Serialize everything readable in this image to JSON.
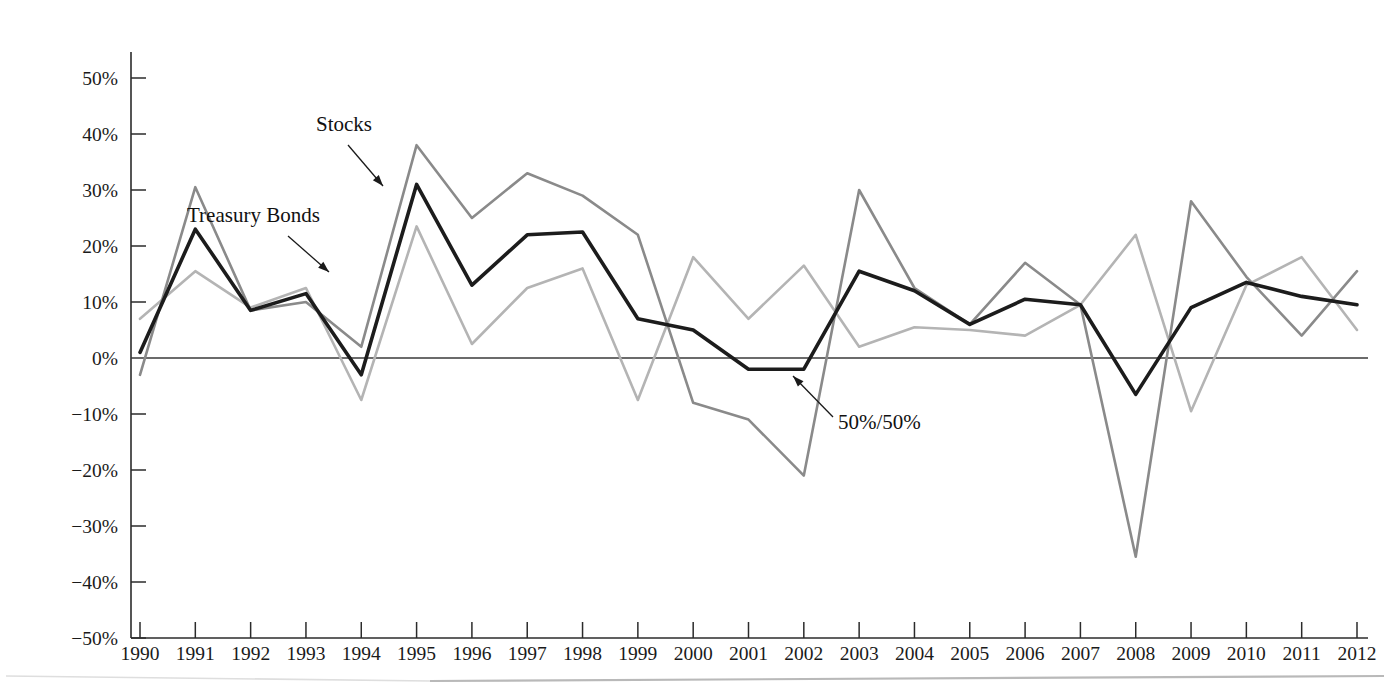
{
  "chart_data": {
    "type": "line",
    "title": "",
    "subtitle": "",
    "xlabel": "",
    "ylabel": "",
    "x": [
      1990,
      1991,
      1992,
      1993,
      1994,
      1995,
      1996,
      1997,
      1998,
      1999,
      2000,
      2001,
      2002,
      2003,
      2004,
      2005,
      2006,
      2007,
      2008,
      2009,
      2010,
      2011,
      2012
    ],
    "categories": [
      "1990",
      "1991",
      "1992",
      "1993",
      "1994",
      "1995",
      "1996",
      "1997",
      "1998",
      "1999",
      "2000",
      "2001",
      "2002",
      "2003",
      "2004",
      "2005",
      "2006",
      "2007",
      "2008",
      "2009",
      "2010",
      "2011",
      "2012"
    ],
    "xlim": [
      1990,
      2012
    ],
    "ylim": [
      -50,
      50
    ],
    "y_tick_values": [
      50,
      40,
      30,
      20,
      10,
      0,
      -10,
      -20,
      -30,
      -40,
      -50
    ],
    "y_tick_labels": [
      "50%",
      "40%",
      "30%",
      "20%",
      "10%",
      "0%",
      "−10%",
      "−20%",
      "−30%",
      "−40%",
      "−50%"
    ],
    "grid": false,
    "legend": "none",
    "units": "percent",
    "series": [
      {
        "name": "Stocks",
        "color": "#8a8a8a",
        "values": [
          -3,
          30.5,
          8.5,
          10,
          2,
          38,
          25,
          33,
          29,
          22,
          -8,
          -11,
          -21,
          30,
          12.5,
          6,
          17,
          9.5,
          -35.5,
          28,
          14.5,
          4,
          15.5
        ]
      },
      {
        "name": "Treasury Bonds",
        "color": "#b4b4b4",
        "values": [
          7,
          15.5,
          9,
          12.5,
          -7.5,
          23.5,
          2.5,
          12.5,
          16,
          -7.5,
          18,
          7,
          16.5,
          2,
          5.5,
          5,
          4,
          9.5,
          22,
          -9.5,
          13,
          18,
          5
        ]
      },
      {
        "name": "50%/50%",
        "color": "#1c1c1c",
        "values": [
          1,
          23,
          8.5,
          11.5,
          -3,
          31,
          13,
          22,
          22.5,
          7,
          5,
          -2,
          -2,
          15.5,
          12,
          6,
          10.5,
          9.5,
          -6.5,
          9,
          13.5,
          11,
          9.5
        ]
      }
    ],
    "annotations": [
      {
        "text": "Stocks",
        "label_x": 316,
        "label_y": 131,
        "leader_from_x": 348,
        "leader_from_y": 145,
        "leader_to_x": 383,
        "leader_to_y": 186,
        "target_series": "50%/50%"
      },
      {
        "text": "Treasury Bonds",
        "label_x": 187,
        "label_y": 222,
        "leader_from_x": 288,
        "leader_from_y": 236,
        "leader_to_x": 329,
        "leader_to_y": 272,
        "target_series": "Treasury Bonds"
      },
      {
        "text": "50%/50%",
        "label_x": 838,
        "label_y": 429,
        "leader_from_x": 833,
        "leader_from_y": 417,
        "leader_to_x": 793,
        "leader_to_y": 376,
        "target_series": "50%/50%"
      }
    ]
  },
  "axis": {
    "y_axis_name": "percent-return-axis",
    "x_axis_name": "year-axis"
  },
  "colors": {
    "stocks": "#8a8a8a",
    "treasury_bonds": "#b4b4b4",
    "fifty_fifty": "#1c1c1c",
    "axis": "#2b2b2b",
    "background": "#ffffff"
  }
}
